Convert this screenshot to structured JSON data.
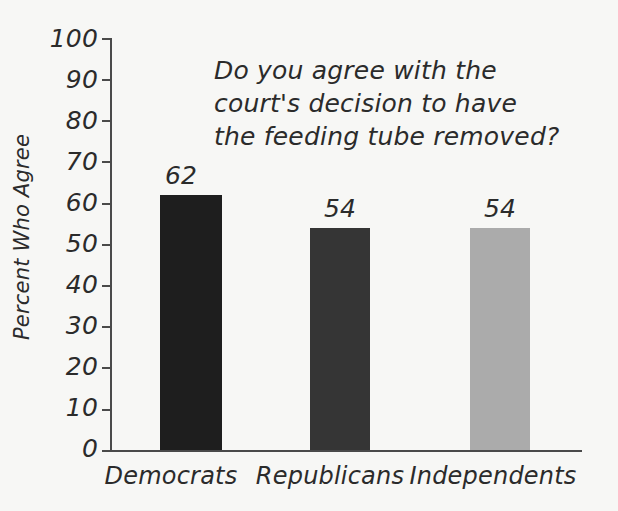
{
  "chart_data": {
    "type": "bar",
    "title": "Do you agree with the court's decision to have the feeding tube removed?",
    "title_lines": [
      "Do you agree with the",
      "court's decision to have",
      "the feeding tube removed?"
    ],
    "xlabel": "",
    "ylabel": "Percent Who Agree",
    "categories": [
      "Democrats",
      "Republicans",
      "Independents"
    ],
    "values": [
      62,
      54,
      54
    ],
    "value_labels": [
      "62",
      "54",
      "54"
    ],
    "bar_colors": [
      "#1e1e1e",
      "#353535",
      "#ababab"
    ],
    "ylim": [
      0,
      100
    ],
    "ytick_labels": [
      "100",
      "90",
      "80",
      "70",
      "60",
      "50",
      "40",
      "30",
      "20",
      "10",
      "0"
    ],
    "ytick_values": [
      100,
      90,
      80,
      70,
      60,
      50,
      40,
      30,
      20,
      10,
      0
    ],
    "grid": false,
    "legend": null,
    "axis_color": "#4a4a4a",
    "background_color": "#f7f7f5",
    "text_color": "#2b2b2b"
  }
}
